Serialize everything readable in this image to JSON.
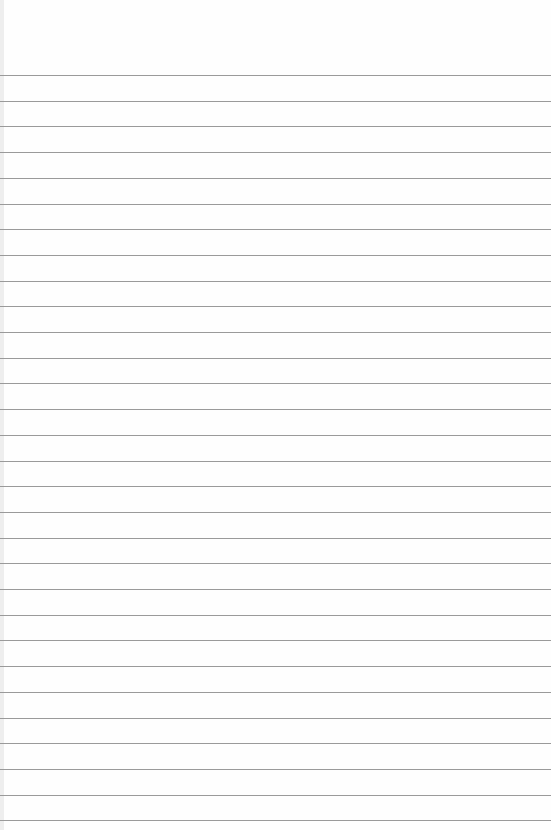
{
  "paper": {
    "background": "#fefefe",
    "line_color": "#9a9a9a",
    "first_line_y": 75,
    "line_spacing": 25.7,
    "line_count": 30
  }
}
